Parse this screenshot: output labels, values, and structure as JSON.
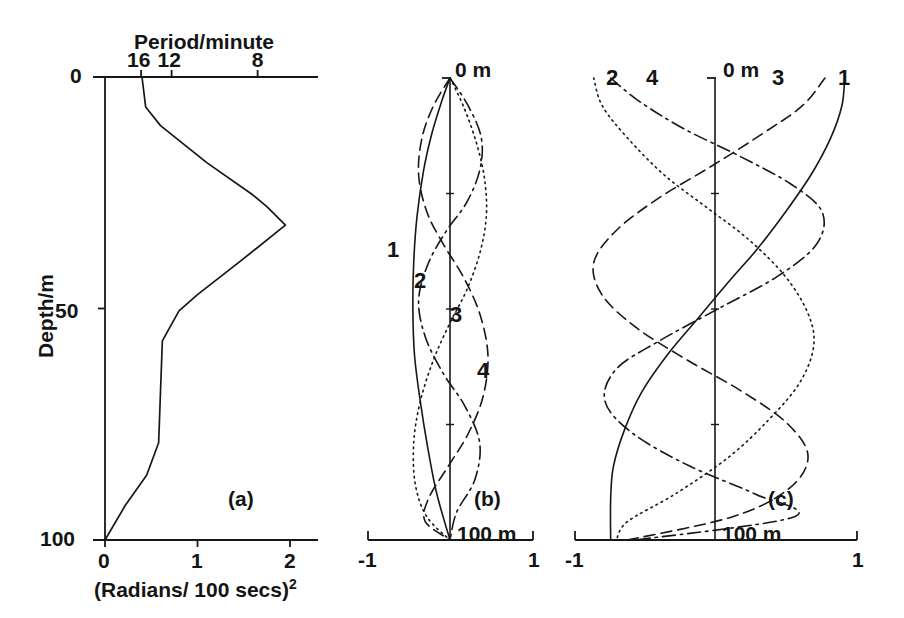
{
  "figure": {
    "panels": [
      {
        "tag": "(a)",
        "tag_pos": [
          228,
          487
        ],
        "top_axis_title": "Period/minute",
        "top_axis_title_pos": [
          134,
          30
        ],
        "top_ticks": [
          {
            "label": "16",
            "x": 141
          },
          {
            "label": "12",
            "x": 172
          },
          {
            "label": "8",
            "x": 258
          }
        ],
        "bottom_ticks": [
          {
            "label": "0",
            "x": 105
          },
          {
            "label": "1",
            "x": 198
          },
          {
            "label": "2",
            "x": 290
          }
        ],
        "bottom_axis_title": "(Radians/ 100 secs)",
        "bottom_axis_exponent": "2",
        "y_axis_title": "Depth/m",
        "y_ticks": [
          {
            "label": "0",
            "y": 77
          },
          {
            "label": "50",
            "y": 312
          },
          {
            "label": "100",
            "y": 540
          }
        ]
      },
      {
        "tag": "(b)",
        "tag_pos": [
          474,
          487
        ],
        "top_label": "0 m",
        "bottom_label": "100 m",
        "x_ticks": [
          {
            "label": "-1",
            "x": 368
          },
          {
            "label": "1",
            "x": 533
          }
        ],
        "curve_labels": [
          {
            "label": "1",
            "x": 387,
            "y": 237
          },
          {
            "label": "2",
            "x": 414,
            "y": 268
          },
          {
            "label": "3",
            "x": 450,
            "y": 302
          },
          {
            "label": "4",
            "x": 477,
            "y": 358
          }
        ]
      },
      {
        "tag": "(c)",
        "tag_pos": [
          768,
          487
        ],
        "top_label": "0 m",
        "bottom_label": "100 m",
        "x_ticks": [
          {
            "label": "-1",
            "x": 575
          },
          {
            "label": "1",
            "x": 857
          }
        ],
        "curve_labels": [
          {
            "label": "2",
            "x": 606,
            "y": 65
          },
          {
            "label": "4",
            "x": 646,
            "y": 65
          },
          {
            "label": "3",
            "x": 772,
            "y": 65
          },
          {
            "label": "1",
            "x": 838,
            "y": 65
          }
        ]
      }
    ]
  },
  "chart_data": [
    {
      "type": "line",
      "panel": "(a)",
      "title": "Brunt-Vaisala frequency squared profile",
      "xlabel": "(Radians/ 100 secs)^2",
      "ylabel": "Depth/m",
      "top_xlabel": "Period/minute",
      "xlim": [
        0,
        2.1
      ],
      "ylim": [
        0,
        100
      ],
      "y_inverted": true,
      "xticks": [
        0,
        1,
        2
      ],
      "yticks": [
        0,
        50,
        100
      ],
      "top_xticks": [
        {
          "period_minutes": 16,
          "n2": 0.39
        },
        {
          "period_minutes": 12,
          "n2": 0.72
        },
        {
          "period_minutes": 8,
          "n2": 1.65
        }
      ],
      "grid": false,
      "legend": "none",
      "series": [
        {
          "name": "N^2 profile",
          "style": "solid",
          "points": [
            [
              0.4,
              0.0
            ],
            [
              0.44,
              6.5
            ],
            [
              0.6,
              10.5
            ],
            [
              1.1,
              18.5
            ],
            [
              1.6,
              25.5
            ],
            [
              1.75,
              28.0
            ],
            [
              1.95,
              32.0
            ],
            [
              1.45,
              40.0
            ],
            [
              1.0,
              47.0
            ],
            [
              0.8,
              50.5
            ],
            [
              0.62,
              57.0
            ],
            [
              0.6,
              68.0
            ],
            [
              0.58,
              79.0
            ],
            [
              0.45,
              86.0
            ],
            [
              0.22,
              92.5
            ],
            [
              0.0,
              100.0
            ]
          ]
        }
      ]
    },
    {
      "type": "line",
      "panel": "(b)",
      "title": "Vertical displacement mode shapes",
      "xlabel": "",
      "ylabel": "Depth",
      "xlim": [
        -1,
        1
      ],
      "ylim": [
        0,
        100
      ],
      "y_inverted": true,
      "xticks": [
        -1,
        1
      ],
      "grid": false,
      "legend": "inline-labels",
      "top_label": "0 m",
      "bottom_label": "100 m",
      "series": [
        {
          "name": "1",
          "style": "solid",
          "points": [
            [
              0.0,
              0
            ],
            [
              -0.1,
              5
            ],
            [
              -0.22,
              12
            ],
            [
              -0.32,
              20
            ],
            [
              -0.4,
              30
            ],
            [
              -0.44,
              40
            ],
            [
              -0.45,
              50
            ],
            [
              -0.43,
              60
            ],
            [
              -0.36,
              70
            ],
            [
              -0.27,
              80
            ],
            [
              -0.16,
              90
            ],
            [
              0.0,
              100
            ]
          ]
        },
        {
          "name": "2",
          "style": "dotted",
          "points": [
            [
              0.0,
              0
            ],
            [
              0.16,
              6
            ],
            [
              0.32,
              14
            ],
            [
              0.42,
              22
            ],
            [
              0.44,
              30
            ],
            [
              0.36,
              38
            ],
            [
              0.2,
              46
            ],
            [
              0.0,
              53
            ],
            [
              -0.2,
              61
            ],
            [
              -0.36,
              70
            ],
            [
              -0.44,
              79
            ],
            [
              -0.42,
              88
            ],
            [
              -0.28,
              95
            ],
            [
              0.0,
              100
            ]
          ]
        },
        {
          "name": "3",
          "style": "dashed",
          "points": [
            [
              0.0,
              0
            ],
            [
              -0.2,
              6
            ],
            [
              -0.34,
              13
            ],
            [
              -0.38,
              21
            ],
            [
              -0.28,
              29
            ],
            [
              -0.08,
              36
            ],
            [
              0.16,
              43
            ],
            [
              0.36,
              51
            ],
            [
              0.46,
              60
            ],
            [
              0.4,
              69
            ],
            [
              0.22,
              77
            ],
            [
              -0.02,
              84
            ],
            [
              -0.26,
              91
            ],
            [
              -0.3,
              96
            ],
            [
              0.0,
              100
            ]
          ]
        },
        {
          "name": "4",
          "style": "dashdot",
          "points": [
            [
              0.0,
              0
            ],
            [
              0.22,
              6
            ],
            [
              0.38,
              13
            ],
            [
              0.36,
              20
            ],
            [
              0.2,
              27
            ],
            [
              -0.04,
              33
            ],
            [
              -0.26,
              40
            ],
            [
              -0.38,
              48
            ],
            [
              -0.3,
              56
            ],
            [
              -0.08,
              64
            ],
            [
              0.18,
              71
            ],
            [
              0.36,
              79
            ],
            [
              0.3,
              87
            ],
            [
              0.08,
              94
            ],
            [
              0.0,
              100
            ]
          ]
        }
      ]
    },
    {
      "type": "line",
      "panel": "(c)",
      "title": "Horizontal velocity mode shapes",
      "xlabel": "",
      "ylabel": "Depth",
      "xlim": [
        -1,
        1
      ],
      "ylim": [
        0,
        100
      ],
      "y_inverted": true,
      "xticks": [
        -1,
        1
      ],
      "grid": false,
      "legend": "inline-labels",
      "top_label": "0 m",
      "bottom_label": "100 m",
      "series": [
        {
          "name": "1",
          "style": "solid",
          "points": [
            [
              0.92,
              0
            ],
            [
              0.9,
              6
            ],
            [
              0.82,
              13
            ],
            [
              0.68,
              21
            ],
            [
              0.5,
              29
            ],
            [
              0.3,
              37
            ],
            [
              0.1,
              44
            ],
            [
              -0.12,
              52
            ],
            [
              -0.34,
              60
            ],
            [
              -0.52,
              68
            ],
            [
              -0.64,
              76
            ],
            [
              -0.72,
              84
            ],
            [
              -0.74,
              91
            ],
            [
              -0.74,
              100
            ]
          ]
        },
        {
          "name": "2",
          "style": "dotted",
          "points": [
            [
              -0.86,
              0
            ],
            [
              -0.8,
              6
            ],
            [
              -0.62,
              13
            ],
            [
              -0.36,
              21
            ],
            [
              -0.06,
              28
            ],
            [
              0.24,
              35
            ],
            [
              0.5,
              43
            ],
            [
              0.66,
              51
            ],
            [
              0.7,
              58
            ],
            [
              0.6,
              66
            ],
            [
              0.38,
              74
            ],
            [
              0.1,
              82
            ],
            [
              -0.28,
              90
            ],
            [
              -0.62,
              96
            ],
            [
              -0.7,
              100
            ]
          ]
        },
        {
          "name": "3",
          "style": "dashed",
          "points": [
            [
              0.78,
              0
            ],
            [
              0.62,
              6
            ],
            [
              0.34,
              12
            ],
            [
              -0.02,
              19
            ],
            [
              -0.4,
              26
            ],
            [
              -0.7,
              33
            ],
            [
              -0.86,
              40
            ],
            [
              -0.8,
              47
            ],
            [
              -0.56,
              54
            ],
            [
              -0.2,
              61
            ],
            [
              0.2,
              68
            ],
            [
              0.52,
              75
            ],
            [
              0.66,
              82
            ],
            [
              0.52,
              89
            ],
            [
              0.12,
              95
            ],
            [
              -0.62,
              100
            ]
          ]
        },
        {
          "name": "4",
          "style": "dashdot",
          "points": [
            [
              -0.74,
              0
            ],
            [
              -0.54,
              5
            ],
            [
              -0.22,
              11
            ],
            [
              0.18,
              17
            ],
            [
              0.54,
              23
            ],
            [
              0.76,
              29
            ],
            [
              0.72,
              36
            ],
            [
              0.44,
              43
            ],
            [
              0.02,
              50
            ],
            [
              -0.4,
              57
            ],
            [
              -0.7,
              63
            ],
            [
              -0.78,
              70
            ],
            [
              -0.58,
              77
            ],
            [
              -0.18,
              84
            ],
            [
              0.28,
              90
            ],
            [
              0.56,
              95
            ],
            [
              -0.56,
              100
            ]
          ]
        }
      ]
    }
  ]
}
